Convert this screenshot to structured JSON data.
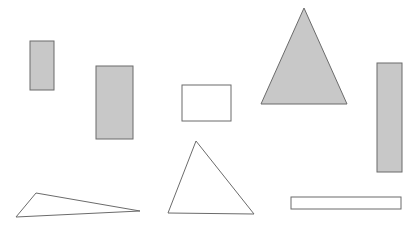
{
  "canvas": {
    "width": 408,
    "height": 230,
    "background": "#ffffff"
  },
  "colors": {
    "stroke": "#6b6b6b",
    "gray_fill": "#c8c8c8",
    "white_fill": "#ffffff"
  },
  "shapes": [
    {
      "name": "gray-rectangle-small",
      "type": "rect",
      "x": 30,
      "y": 41,
      "w": 24,
      "h": 49,
      "fill": "gray"
    },
    {
      "name": "gray-rectangle-medium",
      "type": "rect",
      "x": 96,
      "y": 66,
      "w": 37,
      "h": 73,
      "fill": "gray"
    },
    {
      "name": "white-rectangle-square",
      "type": "rect",
      "x": 182,
      "y": 85,
      "w": 49,
      "h": 36,
      "fill": "white"
    },
    {
      "name": "gray-triangle-large",
      "type": "polygon",
      "points": "304,8 261,104 347,104",
      "fill": "gray"
    },
    {
      "name": "gray-rectangle-tall",
      "type": "rect",
      "x": 377,
      "y": 63,
      "w": 25,
      "h": 109,
      "fill": "gray"
    },
    {
      "name": "white-triangle-flat",
      "type": "polygon",
      "points": "16,217 36,193 140,211",
      "fill": "white"
    },
    {
      "name": "white-triangle-medium",
      "type": "polygon",
      "points": "196,141 168,213 254,214",
      "fill": "white"
    },
    {
      "name": "white-rectangle-wide",
      "type": "rect",
      "x": 291,
      "y": 197,
      "w": 110,
      "h": 12,
      "fill": "white"
    }
  ]
}
